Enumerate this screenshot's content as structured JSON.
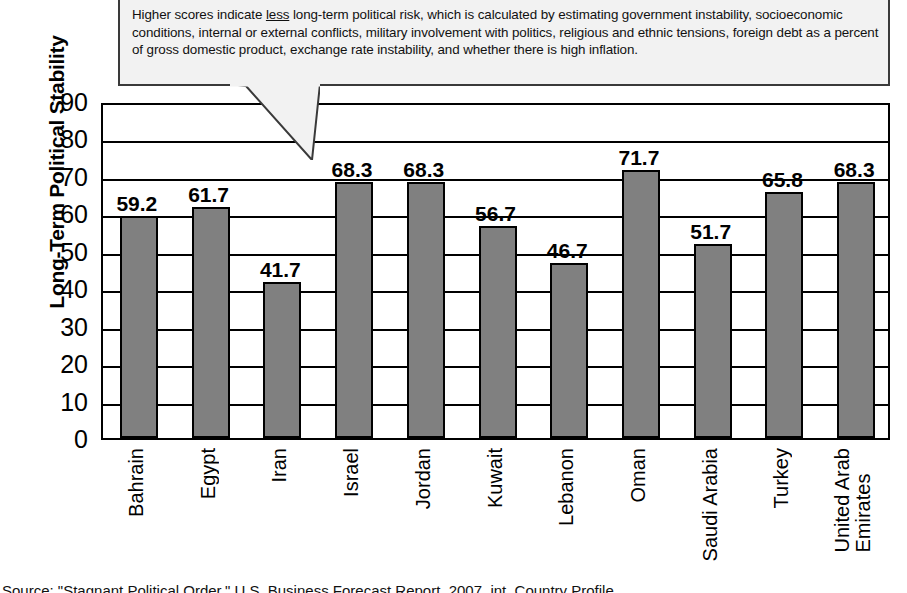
{
  "callout": {
    "line1_a": "Higher scores indicate ",
    "line1_underline": "less",
    "line1_b": " long-term political risk, which is calculated by estimating government",
    "line2": "instability, socioeconomic conditions, internal or external conflicts, military involvement with politics, religious",
    "line3": "and ethnic tensions, foreign debt as a percent of gross domestic product, exchange rate instability, and",
    "line4": "whether there is high inflation."
  },
  "source": {
    "text": "Source: \"Stagnant Political Order,\" U.S. Business Forecast Report, 2007, int. Country Profile"
  },
  "chart_data": {
    "type": "bar",
    "title": "",
    "xlabel": "",
    "ylabel": "Long-Term Political Stability",
    "ylim": [
      0,
      90
    ],
    "yticks": [
      0,
      10,
      20,
      30,
      40,
      50,
      60,
      70,
      80,
      90
    ],
    "ytick_labels": [
      "0",
      "10",
      "20",
      "30",
      "40",
      "50",
      "60",
      "70",
      "80",
      "90"
    ],
    "grid": true,
    "legend": "none",
    "bar_color": "#808080",
    "bar_edge_color": "#000000",
    "categories": [
      "Bahrain",
      "Egypt",
      "Iran",
      "Israel",
      "Jordan",
      "Kuwait",
      "Lebanon",
      "Oman",
      "Saudi Arabia",
      "Turkey",
      "United Arab\nEmirates"
    ],
    "values": [
      59.2,
      61.7,
      41.7,
      68.3,
      68.3,
      56.7,
      46.7,
      71.7,
      51.7,
      65.8,
      68.3
    ],
    "value_labels": [
      "59.2",
      "61.7",
      "41.7",
      "68.3",
      "68.3",
      "56.7",
      "46.7",
      "71.7",
      "51.7",
      "65.8",
      "68.3"
    ]
  }
}
